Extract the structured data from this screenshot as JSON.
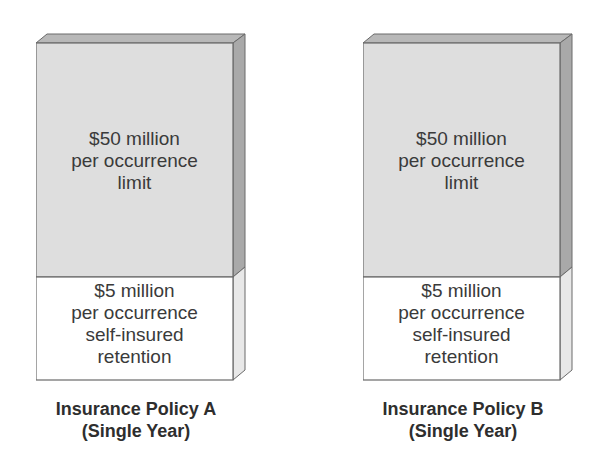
{
  "colors": {
    "upper_face": "#dedede",
    "top_face": "#b8b8b8",
    "side_face_upper": "#a9a9a9",
    "side_face_lower": "#e8e8e8",
    "lower_face": "#ffffff",
    "outline": "#6a6a6a",
    "text": "#3a3a3a"
  },
  "policies": [
    {
      "id": "A",
      "upper_block": {
        "lines": [
          "$50 million",
          "per occurrence",
          "limit"
        ]
      },
      "lower_block": {
        "lines": [
          "$5 million",
          "per occurrence",
          "self-insured",
          "retention"
        ]
      },
      "caption": [
        "Insurance Policy A",
        "(Single Year)"
      ]
    },
    {
      "id": "B",
      "upper_block": {
        "lines": [
          "$50 million",
          "per occurrence",
          "limit"
        ]
      },
      "lower_block": {
        "lines": [
          "$5 million",
          "per occurrence",
          "self-insured",
          "retention"
        ]
      },
      "caption": [
        "Insurance Policy B",
        "(Single Year)"
      ]
    }
  ]
}
